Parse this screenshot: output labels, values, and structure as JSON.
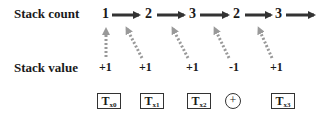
{
  "rows": {
    "count_label": "Stack count",
    "value_label": "Stack value"
  },
  "stack_counts": [
    "1",
    "2",
    "3",
    "2",
    "3"
  ],
  "stack_values": [
    "+1",
    "+1",
    "+1",
    "-1",
    "+1"
  ],
  "tokens": [
    {
      "base": "T",
      "sub": "x0"
    },
    {
      "base": "T",
      "sub": "x1"
    },
    {
      "base": "T",
      "sub": "x2"
    },
    {
      "symbol": "+"
    },
    {
      "base": "T",
      "sub": "x3"
    }
  ],
  "colors": {
    "solid_arrow": "#333333",
    "dotted_arrow": "#999999",
    "text": "#1a1a1a"
  }
}
